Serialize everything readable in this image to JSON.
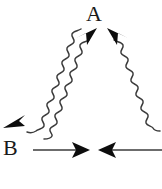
{
  "figure": {
    "width": 162,
    "height": 189,
    "background": "#ffffff",
    "stroke_color": "#3b3b3b",
    "arrow_fill": "#0d0d0d",
    "text_color": "#1a1a1a",
    "labels": {
      "apex": "A",
      "baseline": "B"
    },
    "elements": {
      "wavy_left_outer_name": "wavy-arrow-down-left",
      "wavy_left_inner_name": "wavy-line-up-left",
      "wavy_right_name": "wavy-arrow-up-right",
      "straight_right_name": "straight-arrow-right",
      "straight_left_name": "straight-arrow-left"
    },
    "arrowheads": [
      {
        "id": "apex-left",
        "direction": "up-right",
        "x": 90,
        "y": 36
      },
      {
        "id": "apex-right",
        "direction": "up-left",
        "x": 110,
        "y": 36
      },
      {
        "id": "lower-left",
        "direction": "down-left",
        "x": 12,
        "y": 122
      },
      {
        "id": "baseline-right",
        "direction": "right",
        "x": 84,
        "y": 150
      },
      {
        "id": "baseline-left",
        "direction": "left",
        "x": 104,
        "y": 150
      }
    ]
  }
}
